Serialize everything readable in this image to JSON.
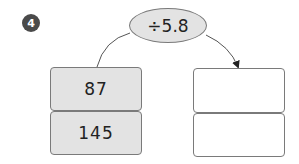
{
  "problem": {
    "number": "4"
  },
  "operation": {
    "label": "÷5.8"
  },
  "inputs": {
    "values": [
      "87",
      "145"
    ]
  },
  "outputs": {
    "values": [
      "",
      ""
    ]
  },
  "colors": {
    "badge_bg": "#4a4a4a",
    "filled_box_bg": "#e3e3e3",
    "stroke": "#7a7a7a",
    "text": "#222222"
  }
}
